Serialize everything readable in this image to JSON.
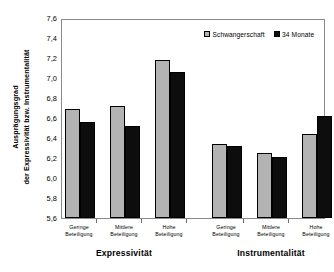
{
  "chart_data": {
    "type": "bar",
    "title": "",
    "subtitle": "",
    "xlabel": "",
    "ylabel": "Ausprägungsgrad der Expressivität bzw. Instrumentalität",
    "ylabel_lines": [
      "Ausprägungsgrad",
      "der Expressivität bzw. Instrumentalität"
    ],
    "ylim": [
      5.6,
      7.6
    ],
    "ytick_labels": [
      "7,6",
      "7,4",
      "7,2",
      "7,0",
      "6,8",
      "6,6",
      "6,4",
      "6,2",
      "6,0",
      "5,8",
      "5,6"
    ],
    "ytick_values": [
      7.6,
      7.4,
      7.2,
      7.0,
      6.8,
      6.6,
      6.4,
      6.2,
      6.0,
      5.8,
      5.6
    ],
    "grid": false,
    "legend_position": "top-right",
    "categories": [
      "Geringe Beteiligung",
      "Mittlere Beteiligung",
      "Hohe Beteiligung",
      "Geringe Beteiligung",
      "Mittlere Beteiligung",
      "Hohe Beteiligung"
    ],
    "category_lines": [
      [
        "Geringe",
        "Beteiligung"
      ],
      [
        "Mittlere",
        "Beteiligung"
      ],
      [
        "Hohe",
        "Beteiligung"
      ],
      [
        "Geringe",
        "Beteiligung"
      ],
      [
        "Mittlere",
        "Beteiligung"
      ],
      [
        "Hohe",
        "Beteiligung"
      ]
    ],
    "groups": [
      {
        "label": "Expressivität",
        "categories": [
          "Geringe Beteiligung",
          "Mittlere Beteiligung",
          "Hohe Beteiligung"
        ]
      },
      {
        "label": "Instrumentalität",
        "categories": [
          "Geringe Beteiligung",
          "Mittlere Beteiligung",
          "Hohe Beteiligung"
        ]
      }
    ],
    "series": [
      {
        "name": "Schwangerschaft",
        "color": "#b3b3b3",
        "values": [
          6.69,
          6.72,
          7.18,
          6.34,
          6.25,
          6.44
        ]
      },
      {
        "name": "34 Monate",
        "color": "#0d0d0d",
        "values": [
          6.56,
          6.52,
          7.06,
          6.32,
          6.21,
          6.62
        ]
      }
    ]
  },
  "legend": {
    "entries": [
      {
        "label": "Schwangerschaft",
        "swatch": "light"
      },
      {
        "label": "34 Monate",
        "swatch": "dark"
      }
    ]
  }
}
